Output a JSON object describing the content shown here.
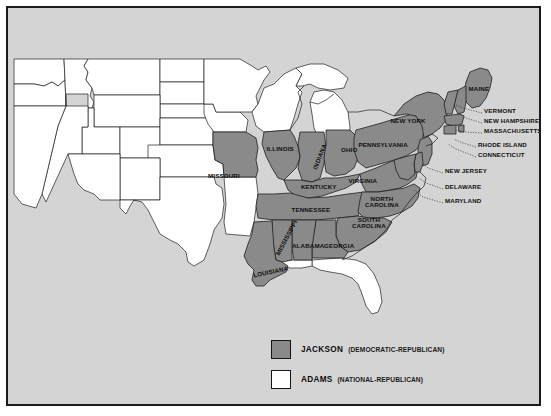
{
  "map": {
    "title": "United States Presidential Election 1828 results map",
    "colors": {
      "jackson_fill": "#8a8a8a",
      "adams_fill": "#ffffff",
      "background": "#d4d4d4",
      "water_land_outside": "#d4d4d4",
      "border": "#1a1a1a",
      "state_outline": "#202020",
      "label_text": "#101010"
    },
    "state_labels": [
      {
        "name": "MISSOURI",
        "x": 216,
        "y": 167,
        "rot": 0,
        "lines": [
          "MISSOURI"
        ]
      },
      {
        "name": "ILLINOIS",
        "x": 272,
        "y": 140,
        "rot": 0,
        "lines": [
          "ILLINOIS"
        ]
      },
      {
        "name": "INDIANA",
        "x": 311,
        "y": 148,
        "rot": -68,
        "lines": [
          "INDIANA"
        ]
      },
      {
        "name": "OHIO",
        "x": 341,
        "y": 141,
        "rot": 0,
        "lines": [
          "OHIO"
        ]
      },
      {
        "name": "KENTUCKY",
        "x": 311,
        "y": 178,
        "rot": 0,
        "lines": [
          "KENTUCKY"
        ]
      },
      {
        "name": "TENNESSEE",
        "x": 303,
        "y": 201,
        "rot": 0,
        "lines": [
          "TENNESSEE"
        ]
      },
      {
        "name": "VIRGINIA",
        "x": 355,
        "y": 172,
        "rot": 0,
        "lines": [
          "VIRGINIA"
        ]
      },
      {
        "name": "NORTH CAROLINA",
        "x": 374,
        "y": 194,
        "rot": 0,
        "lines": [
          "NORTH",
          "CAROLINA"
        ]
      },
      {
        "name": "SOUTH CAROLINA",
        "x": 361,
        "y": 215,
        "rot": 0,
        "lines": [
          "SOUTH",
          "CAROLINA"
        ]
      },
      {
        "name": "GEORGIA",
        "x": 331,
        "y": 237,
        "rot": 0,
        "lines": [
          "GEORGIA"
        ]
      },
      {
        "name": "ALABAMA",
        "x": 300,
        "y": 237,
        "rot": 0,
        "lines": [
          "ALABAMA"
        ]
      },
      {
        "name": "MISSISSIPPI",
        "x": 278,
        "y": 229,
        "rot": -62,
        "lines": [
          "MISSISSIPPI"
        ]
      },
      {
        "name": "LOUISIANA",
        "x": 262,
        "y": 263,
        "rot": -12,
        "lines": [
          "LOUISIANA"
        ]
      },
      {
        "name": "PENNSYLVANIA",
        "x": 375,
        "y": 136,
        "rot": 0,
        "lines": [
          "PENNSYLVANIA"
        ]
      },
      {
        "name": "NEW YORK",
        "x": 400,
        "y": 112,
        "rot": 0,
        "lines": [
          "NEW YORK"
        ]
      },
      {
        "name": "MAINE",
        "x": 471,
        "y": 80,
        "rot": 0,
        "lines": [
          "MAINE"
        ]
      }
    ],
    "callout_labels": [
      {
        "name": "VERMONT",
        "x": 476,
        "y": 102,
        "leader": [
          [
            474,
            105
          ],
          [
            455,
            100
          ],
          [
            448,
            97
          ]
        ]
      },
      {
        "name": "NEW HAMPSHIRE",
        "x": 476,
        "y": 112,
        "leader": [
          [
            474,
            115
          ],
          [
            458,
            110
          ],
          [
            452,
            106
          ]
        ]
      },
      {
        "name": "MASSACHUSETTS",
        "x": 476,
        "y": 122,
        "leader": [
          [
            474,
            125
          ],
          [
            456,
            124
          ],
          [
            448,
            122
          ]
        ]
      },
      {
        "name": "RHODE ISLAND",
        "x": 470,
        "y": 136,
        "leader": [
          [
            468,
            139
          ],
          [
            452,
            134
          ],
          [
            446,
            131
          ]
        ]
      },
      {
        "name": "CONNECTICUT",
        "x": 470,
        "y": 146,
        "leader": [
          [
            468,
            149
          ],
          [
            448,
            141
          ],
          [
            440,
            136
          ]
        ]
      },
      {
        "name": "NEW JERSEY",
        "x": 437,
        "y": 162,
        "leader": [
          [
            435,
            165
          ],
          [
            420,
            160
          ],
          [
            414,
            155
          ]
        ]
      },
      {
        "name": "DELAWARE",
        "x": 437,
        "y": 178,
        "leader": [
          [
            435,
            181
          ],
          [
            418,
            175
          ],
          [
            411,
            170
          ]
        ]
      },
      {
        "name": "MARYLAND",
        "x": 437,
        "y": 192,
        "leader": [
          [
            435,
            195
          ],
          [
            415,
            189
          ],
          [
            406,
            182
          ]
        ]
      }
    ]
  },
  "legend": {
    "title": "Legend",
    "items": [
      {
        "candidate": "JACKSON",
        "party": "(DEMOCRATIC-REPUBLICAN)",
        "swatch": "#8a8a8a",
        "y": 0
      },
      {
        "candidate": "ADAMS",
        "party": "(NATIONAL-REPUBLICAN)",
        "swatch": "#ffffff",
        "y": 30
      }
    ]
  }
}
